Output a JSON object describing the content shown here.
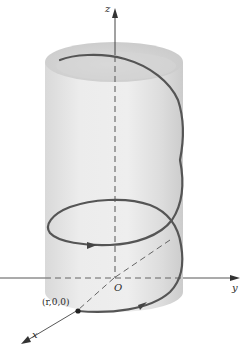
{
  "figure": {
    "axes": {
      "x_label": "x",
      "y_label": "y",
      "z_label": "z",
      "origin_label": "O"
    },
    "points": [
      {
        "label": "(r,0,0)",
        "role": "helix start point on x-axis"
      }
    ],
    "curve": {
      "name": "helix",
      "direction_arrows": 3,
      "turns_visible": 1.75
    },
    "surface": {
      "name": "cylinder",
      "shading": "light gray"
    },
    "colors": {
      "helix": "#555555",
      "axes": "#444444",
      "cylinder_fill": "#e6e6e6",
      "cylinder_shadow": "#cfcfcf",
      "background": "#ffffff"
    }
  }
}
